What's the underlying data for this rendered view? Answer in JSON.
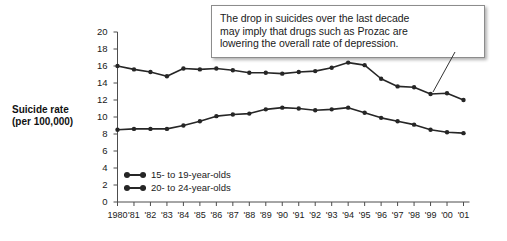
{
  "annotation": {
    "name": "annotation-callout",
    "lines": [
      "The drop in suicides over the last decade",
      "may imply that drugs such as Prozac are",
      "lowering the overall rate of depression."
    ]
  },
  "axis_title": {
    "line1": "Suicide rate",
    "line2": "(per 100,000)"
  },
  "legend": {
    "items": [
      {
        "label": "15- to 19-year-olds",
        "color": "#262626"
      },
      {
        "label": "20- to 24-year-olds",
        "color": "#262626"
      }
    ]
  },
  "chart_data": {
    "type": "line",
    "title": "",
    "xlabel": "",
    "ylabel": "Suicide rate (per 100,000)",
    "ylim": [
      0,
      20
    ],
    "ytick_step": 2,
    "yticks": [
      20,
      18,
      16,
      14,
      12,
      10,
      8,
      6,
      4,
      2,
      0
    ],
    "grid": false,
    "legend_position": "inside-bottom-left",
    "categories": [
      "1980",
      "'81",
      "'82",
      "'83",
      "'84",
      "'85",
      "'86",
      "'87",
      "'88",
      "'89",
      "'90",
      "'91",
      "'92",
      "'93",
      "'94",
      "'95",
      "'96",
      "'97",
      "'98",
      "'99",
      "'00",
      "'01"
    ],
    "x": [
      1980,
      1981,
      1982,
      1983,
      1984,
      1985,
      1986,
      1987,
      1988,
      1989,
      1990,
      1991,
      1992,
      1993,
      1994,
      1995,
      1996,
      1997,
      1998,
      1999,
      2000,
      2001
    ],
    "series": [
      {
        "name": "20- to 24-year-olds",
        "color": "#262626",
        "values": [
          16.0,
          15.6,
          15.3,
          14.8,
          15.7,
          15.6,
          15.7,
          15.5,
          15.2,
          15.2,
          15.1,
          15.3,
          15.4,
          15.8,
          16.4,
          16.1,
          14.5,
          13.6,
          13.5,
          12.7,
          12.8,
          12.0
        ]
      },
      {
        "name": "15- to 19-year-olds",
        "color": "#262626",
        "values": [
          8.5,
          8.6,
          8.6,
          8.6,
          9.0,
          9.5,
          10.1,
          10.3,
          10.4,
          10.9,
          11.1,
          11.0,
          10.8,
          10.9,
          11.1,
          10.5,
          9.9,
          9.5,
          9.1,
          8.5,
          8.2,
          8.1
        ]
      }
    ],
    "marker": "circle",
    "axes": {
      "x_axis_line": true,
      "y_axis_line": true,
      "tick_marks": "outward"
    }
  },
  "colors": {
    "line": "#262626",
    "axis": "#4d4d4d",
    "text": "#1a1a1a",
    "callout_border": "#8c8c8c",
    "background": "#ffffff"
  }
}
